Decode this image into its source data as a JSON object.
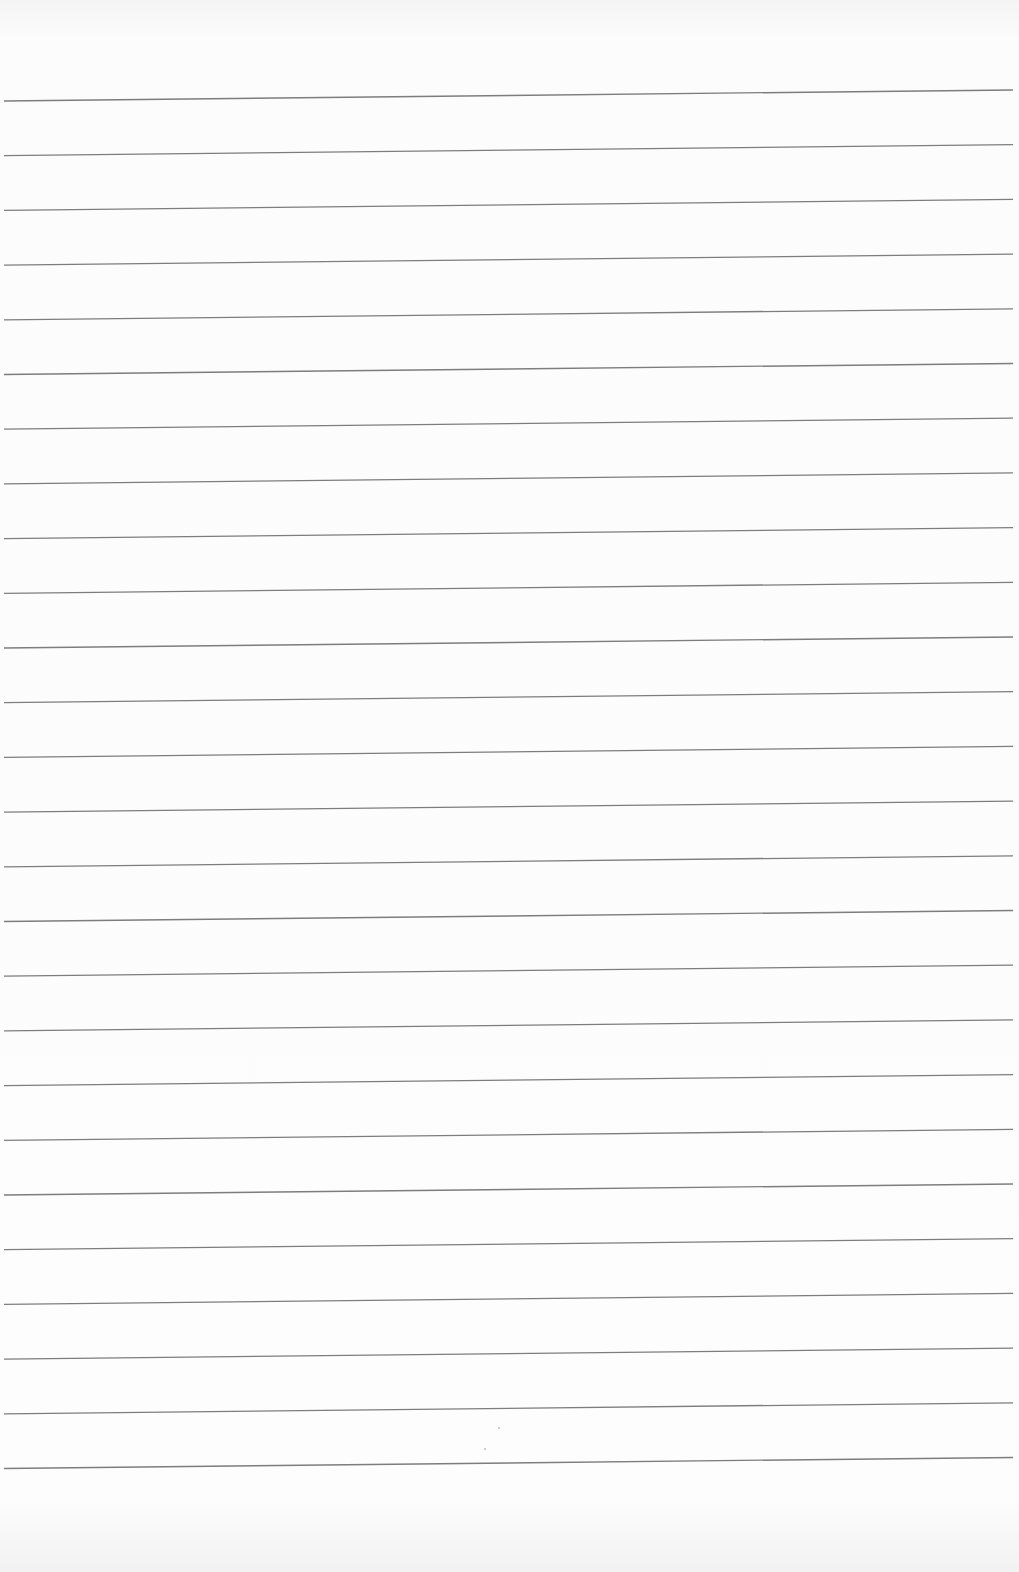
{
  "document": {
    "type": "lined-paper",
    "text": "",
    "rule_count": 26,
    "first_rule_y_left": 101,
    "first_rule_y_right": 90,
    "rule_spacing": 54.7,
    "rule_x_start": 4,
    "rule_x_end": 1013,
    "rule_color": "#7d7d7d",
    "paper_color": "#fcfcfc"
  }
}
